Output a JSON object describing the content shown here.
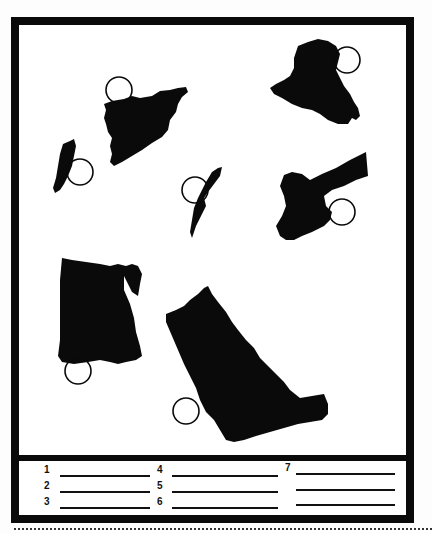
{
  "worksheet": {
    "type": "map-identification",
    "instructions_visible": false,
    "shapes": [
      {
        "id": "syria",
        "label": "Syria silhouette",
        "circle_marker": true
      },
      {
        "id": "lebanon",
        "label": "Lebanon silhouette",
        "circle_marker": true
      },
      {
        "id": "israel",
        "label": "Israel silhouette",
        "circle_marker": true
      },
      {
        "id": "iraq",
        "label": "Iraq silhouette",
        "circle_marker": true
      },
      {
        "id": "jordan",
        "label": "Jordan silhouette",
        "circle_marker": true
      },
      {
        "id": "egypt",
        "label": "Egypt silhouette",
        "circle_marker": true
      },
      {
        "id": "saudi-arabia",
        "label": "Saudi Arabia silhouette",
        "circle_marker": true
      }
    ],
    "answer_blanks": [
      {
        "number": "1",
        "value": ""
      },
      {
        "number": "2",
        "value": ""
      },
      {
        "number": "3",
        "value": ""
      },
      {
        "number": "4",
        "value": ""
      },
      {
        "number": "5",
        "value": ""
      },
      {
        "number": "6",
        "value": ""
      },
      {
        "number": "7",
        "value": ""
      },
      {
        "number": "",
        "value": ""
      },
      {
        "number": "",
        "value": ""
      }
    ]
  },
  "colors": {
    "ink": "#0a0a0a",
    "paper": "#ffffff"
  }
}
